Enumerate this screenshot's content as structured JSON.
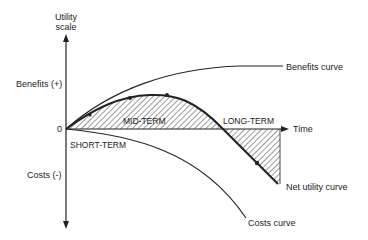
{
  "diagram": {
    "y_axis_label_line1": "Utility",
    "y_axis_label_line2": "scale",
    "benefits_label": "Benefits (+)",
    "costs_label": "Costs (-)",
    "origin_label": "0",
    "x_axis_label": "Time",
    "curves": {
      "benefits": "Benefits curve",
      "net_utility": "Net utility curve",
      "costs": "Costs curve"
    },
    "regions": {
      "short_term": "SHORT-TERM",
      "mid_term": "MID-TERM",
      "long_term": "LONG-TERM"
    },
    "colors": {
      "ink": "#222222",
      "background": "#ffffff"
    }
  }
}
